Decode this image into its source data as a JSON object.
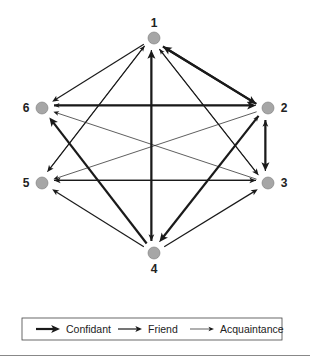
{
  "diagram": {
    "type": "directed-network",
    "nodes": [
      {
        "id": "1",
        "label": "1",
        "x": 154,
        "y": 38,
        "label_x": 154,
        "label_y": 27
      },
      {
        "id": "2",
        "label": "2",
        "x": 268,
        "y": 108,
        "label_x": 284,
        "label_y": 112
      },
      {
        "id": "3",
        "label": "3",
        "x": 268,
        "y": 183,
        "label_x": 284,
        "label_y": 187
      },
      {
        "id": "4",
        "label": "4",
        "x": 154,
        "y": 253,
        "label_x": 154,
        "label_y": 273
      },
      {
        "id": "5",
        "label": "5",
        "x": 42,
        "y": 183,
        "label_x": 26,
        "label_y": 187
      },
      {
        "id": "6",
        "label": "6",
        "x": 42,
        "y": 108,
        "label_x": 26,
        "label_y": 112
      }
    ],
    "node_color": "#a6a6a6",
    "edge_color": "#1a1a1a",
    "edges": [
      {
        "from": "1",
        "to": "6",
        "type": "friend"
      },
      {
        "from": "1",
        "to": "2",
        "type": "confidant"
      },
      {
        "from": "2",
        "to": "1",
        "type": "confidant"
      },
      {
        "from": "6",
        "to": "2",
        "type": "confidant"
      },
      {
        "from": "2",
        "to": "6",
        "type": "acquaintance"
      },
      {
        "from": "2",
        "to": "3",
        "type": "confidant"
      },
      {
        "from": "3",
        "to": "2",
        "type": "friend"
      },
      {
        "from": "4",
        "to": "1",
        "type": "confidant"
      },
      {
        "from": "1",
        "to": "4",
        "type": "friend"
      },
      {
        "from": "5",
        "to": "1",
        "type": "acquaintance"
      },
      {
        "from": "1",
        "to": "5",
        "type": "friend"
      },
      {
        "from": "3",
        "to": "1",
        "type": "acquaintance"
      },
      {
        "from": "1",
        "to": "3",
        "type": "friend"
      },
      {
        "from": "4",
        "to": "6",
        "type": "confidant"
      },
      {
        "from": "3",
        "to": "6",
        "type": "acquaintance"
      },
      {
        "from": "4",
        "to": "2",
        "type": "acquaintance"
      },
      {
        "from": "2",
        "to": "4",
        "type": "confidant"
      },
      {
        "from": "4",
        "to": "5",
        "type": "friend"
      },
      {
        "from": "4",
        "to": "3",
        "type": "friend"
      },
      {
        "from": "3",
        "to": "5",
        "type": "friend"
      },
      {
        "from": "5",
        "to": "3",
        "type": "friend"
      },
      {
        "from": "2",
        "to": "5",
        "type": "acquaintance"
      }
    ],
    "edge_styles": {
      "confidant": {
        "width": 2.2
      },
      "friend": {
        "width": 1.2
      },
      "acquaintance": {
        "width": 0.7
      }
    }
  },
  "legend": {
    "items": [
      {
        "type": "confidant",
        "label": "Confidant"
      },
      {
        "type": "friend",
        "label": "Friend"
      },
      {
        "type": "acquaintance",
        "label": "Acquaintance"
      }
    ]
  }
}
